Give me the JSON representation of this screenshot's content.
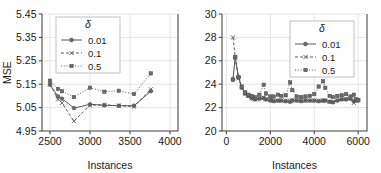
{
  "figure": {
    "panel_count": 2,
    "background": "#ffffff",
    "line_color": "#595959",
    "grid_color": "#d9d9d9",
    "axis_color": "#4a4a4a"
  },
  "legend": {
    "title": "δ",
    "entries": [
      {
        "label": "0.01",
        "style": "solid",
        "marker": "circle"
      },
      {
        "label": "0.1",
        "style": "dashed",
        "marker": "x"
      },
      {
        "label": "0.5",
        "style": "dotted",
        "marker": "square"
      }
    ],
    "position": "upper-left"
  },
  "legend_right": {
    "title": "δ",
    "entries": [
      {
        "label": "0.01",
        "style": "solid",
        "marker": "circle"
      },
      {
        "label": "0.1",
        "style": "dashed",
        "marker": "x"
      },
      {
        "label": "0.5",
        "style": "dotted",
        "marker": "square"
      }
    ],
    "position": "upper-right"
  },
  "chart_data": [
    {
      "type": "line",
      "id": "left-panel",
      "title": "",
      "xlabel": "Instances",
      "ylabel": "MSE",
      "xlim": [
        2400,
        4100
      ],
      "ylim": [
        4.95,
        5.45
      ],
      "xticks": [
        2500,
        3000,
        3500,
        4000
      ],
      "yticks": [
        4.95,
        5.05,
        5.15,
        5.25,
        5.35,
        5.45
      ],
      "grid": true,
      "legend_position": "upper-left",
      "x": [
        2500,
        2600,
        2650,
        2800,
        3000,
        3180,
        3360,
        3550,
        3760
      ],
      "series": [
        {
          "name": "0.01",
          "delta": 0.01,
          "style": "solid",
          "marker": "circle",
          "values": [
            5.148,
            5.098,
            5.088,
            5.048,
            5.064,
            5.06,
            5.058,
            5.058,
            5.12
          ]
        },
        {
          "name": "0.1",
          "delta": 0.1,
          "style": "dashed",
          "marker": "x",
          "values": [
            5.15,
            5.085,
            5.07,
            4.992,
            5.06,
            5.062,
            5.058,
            5.054,
            5.128
          ]
        },
        {
          "name": "0.5",
          "delta": 0.5,
          "style": "dotted",
          "marker": "square",
          "values": [
            5.165,
            5.13,
            5.12,
            5.095,
            5.135,
            5.118,
            5.122,
            5.108,
            5.196
          ]
        }
      ]
    },
    {
      "type": "line",
      "id": "right-panel",
      "title": "",
      "xlabel": "Instances",
      "ylabel": "",
      "xlim": [
        -200,
        6400
      ],
      "ylim": [
        20,
        30
      ],
      "xticks": [
        0,
        2000,
        4000,
        6000
      ],
      "yticks": [
        20,
        22,
        24,
        26,
        28,
        30
      ],
      "grid": true,
      "legend_position": "upper-right",
      "x": [
        300,
        400,
        550,
        700,
        850,
        1000,
        1150,
        1300,
        1500,
        1700,
        1800,
        2000,
        2150,
        2350,
        2500,
        2700,
        2900,
        3000,
        3200,
        3400,
        3600,
        3800,
        4000,
        4200,
        4400,
        4500,
        4700,
        4850,
        5050,
        5250,
        5450,
        5650,
        5800,
        5900,
        6000
      ],
      "series": [
        {
          "name": "0.01",
          "delta": 0.01,
          "style": "solid",
          "marker": "circle",
          "values": [
            24.4,
            26.3,
            24.6,
            23.7,
            23.2,
            23.0,
            22.8,
            22.7,
            22.75,
            22.8,
            22.7,
            22.6,
            22.55,
            22.6,
            22.6,
            22.55,
            22.5,
            22.6,
            22.6,
            22.55,
            22.6,
            22.6,
            22.6,
            22.55,
            22.6,
            22.6,
            22.5,
            22.45,
            22.6,
            22.7,
            22.7,
            22.75,
            22.55,
            22.6,
            22.6
          ]
        },
        {
          "name": "0.1",
          "delta": 0.1,
          "style": "dashed",
          "marker": "x",
          "values": [
            28.0,
            26.3,
            24.5,
            23.75,
            23.2,
            23.0,
            22.8,
            22.7,
            22.8,
            22.85,
            22.7,
            22.65,
            22.6,
            22.6,
            22.6,
            22.6,
            22.55,
            22.65,
            22.6,
            22.6,
            22.6,
            22.6,
            22.6,
            22.6,
            22.6,
            22.6,
            22.5,
            22.5,
            22.65,
            22.7,
            22.75,
            22.8,
            22.4,
            22.7,
            22.65
          ]
        },
        {
          "name": "0.5",
          "delta": 0.5,
          "style": "dotted",
          "marker": "square",
          "values": [
            24.4,
            26.3,
            24.6,
            23.8,
            23.3,
            23.1,
            23.0,
            22.9,
            23.1,
            23.95,
            23.2,
            22.95,
            22.95,
            23.1,
            23.0,
            23.05,
            24.15,
            23.5,
            22.95,
            22.9,
            22.95,
            23.0,
            23.15,
            23.8,
            24.25,
            23.7,
            23.0,
            22.9,
            23.0,
            23.05,
            23.15,
            22.95,
            23.1,
            22.7,
            22.65
          ]
        }
      ]
    }
  ]
}
